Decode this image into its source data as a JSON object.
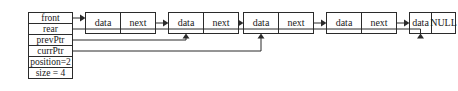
{
  "diagram": {
    "colors": {
      "stroke": "#2b2b2b",
      "text": "#1a1a1a",
      "background": "#ffffff"
    },
    "state_table": {
      "name": "list-state-table",
      "rows": [
        {
          "label": "front",
          "name": "front"
        },
        {
          "label": "rear",
          "name": "rear"
        },
        {
          "label": "prevPtr",
          "name": "prevPtr"
        },
        {
          "label": "currPtr",
          "name": "currPtr"
        },
        {
          "label": "position=2",
          "name": "position"
        },
        {
          "label": "size = 4",
          "name": "size"
        }
      ]
    },
    "nodes": [
      {
        "index": 1,
        "data_label": "data",
        "link_label": "next"
      },
      {
        "index": 2,
        "data_label": "data",
        "link_label": "next"
      },
      {
        "index": 3,
        "data_label": "data",
        "link_label": "next"
      },
      {
        "index": 4,
        "data_label": "data",
        "link_label": "next"
      },
      {
        "index": 5,
        "data_label": "data",
        "link_label": "NULL"
      }
    ],
    "pointers": [
      {
        "from": "front",
        "to_node": 1,
        "kind": "horizontal-arrow"
      },
      {
        "from": "rear",
        "to_node": 5,
        "kind": "routed-up-arrow"
      },
      {
        "from": "prevPtr",
        "to_node": 2,
        "kind": "routed-up-arrow"
      },
      {
        "from": "currPtr",
        "to_node": 3,
        "kind": "routed-up-arrow"
      }
    ],
    "node_links": [
      {
        "from_node": 1,
        "to_node": 2
      },
      {
        "from_node": 2,
        "to_node": 3
      },
      {
        "from_node": 3,
        "to_node": 4
      },
      {
        "from_node": 4,
        "to_node": 5
      }
    ]
  }
}
